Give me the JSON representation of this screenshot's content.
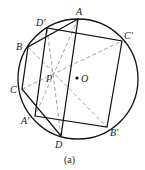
{
  "figure": {
    "caption": "(a)",
    "circle": {
      "cx": 78,
      "cy": 79,
      "r": 60
    },
    "center": {
      "name": "O",
      "x": 77,
      "y": 78,
      "label_x": 81,
      "label_y": 82
    },
    "intersection": {
      "name": "P",
      "x": 53,
      "y": 73,
      "label_x": 46,
      "label_y": 82
    },
    "points": {
      "A": {
        "name": "A",
        "x": 78,
        "y": 19,
        "label_x": 76,
        "label_y": 15
      },
      "B": {
        "name": "B",
        "x": 28,
        "y": 47,
        "label_x": 16,
        "label_y": 50
      },
      "C": {
        "name": "C",
        "x": 22,
        "y": 89,
        "label_x": 10,
        "label_y": 93
      },
      "D": {
        "name": "D",
        "x": 61,
        "y": 136,
        "label_x": 55,
        "label_y": 148
      },
      "A'": {
        "name": "A′",
        "x": 35,
        "y": 116,
        "label_x": 21,
        "label_y": 124
      },
      "B'": {
        "name": "B′",
        "x": 107,
        "y": 127,
        "label_x": 110,
        "label_y": 136
      },
      "C'": {
        "name": "C′",
        "x": 122,
        "y": 41,
        "label_x": 124,
        "label_y": 39
      },
      "D'": {
        "name": "D′",
        "x": 47,
        "y": 28,
        "label_x": 36,
        "label_y": 26
      }
    },
    "quad_1": [
      "A",
      "B",
      "C",
      "D"
    ],
    "quad_2": [
      "A'",
      "B'",
      "C'",
      "D'"
    ],
    "dashed_lines": [
      [
        "A",
        "A'"
      ],
      [
        "B",
        "B'"
      ],
      [
        "C",
        "C'"
      ],
      [
        "D",
        "D'"
      ]
    ],
    "colors": {
      "stroke": "#111111",
      "dashed": "#9a9a9a",
      "text": "#222222"
    }
  }
}
